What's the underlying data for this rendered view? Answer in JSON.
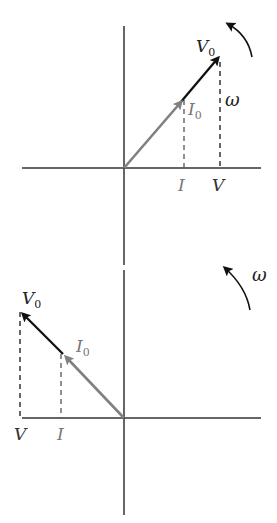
{
  "diagrams": [
    {
      "name": "phasor-in-phase",
      "labels": {
        "voltage_phasor": "V",
        "voltage_sub": "0",
        "current_phasor": "I",
        "current_sub": "0",
        "omega": "ω",
        "v_projection": "V",
        "i_projection": "I"
      }
    },
    {
      "name": "phasor-rotated",
      "labels": {
        "voltage_phasor": "V",
        "voltage_sub": "0",
        "current_phasor": "I",
        "current_sub": "0",
        "omega": "ω",
        "v_projection": "V",
        "i_projection": "I"
      }
    }
  ],
  "colors": {
    "axis": "#333333",
    "voltage": "#111111",
    "current": "#808080",
    "dashed": "#444444"
  }
}
